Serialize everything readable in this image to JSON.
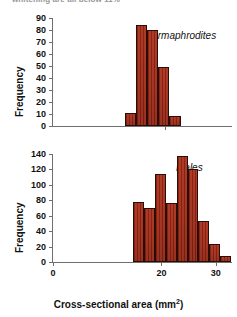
{
  "caption_sliver": "whitening are all below 11%",
  "colors": {
    "bar_fill": "#a32a16",
    "bar_edge": "#2a0d06",
    "axis": "#6f6f6f"
  },
  "axis_titles": {
    "y": "Frequency",
    "x_main": "Cross-sectional area (mm",
    "x_sup": "2",
    "x_close": ")"
  },
  "chart_data": [
    {
      "type": "bar",
      "title": "",
      "series_label": "Hermaphrodites",
      "xlabel": "Cross-sectional area (mm2)",
      "ylabel": "Frequency",
      "ylim": [
        0,
        90
      ],
      "yticks": [
        0,
        10,
        20,
        30,
        40,
        50,
        60,
        70,
        80,
        90
      ],
      "ytick_labels": [
        "0",
        "10",
        "20",
        "30",
        "40",
        "50",
        "60",
        "70",
        "80",
        "90"
      ],
      "xlim": [
        0,
        32
      ],
      "xticks": [
        20
      ],
      "xtick_labels": [
        ""
      ],
      "bin_edges": [
        13,
        15,
        17,
        19,
        21,
        23
      ],
      "values": [
        11,
        84,
        80,
        49,
        8
      ],
      "grid": false,
      "legend": "none"
    },
    {
      "type": "bar",
      "title": "",
      "series_label": "Males",
      "xlabel": "Cross-sectional area (mm2)",
      "ylabel": "Frequency",
      "ylim": [
        0,
        140
      ],
      "yticks": [
        0,
        20,
        40,
        60,
        80,
        100,
        120,
        140
      ],
      "ytick_labels": [
        "0",
        "20",
        "40",
        "60",
        "80",
        "100",
        "120",
        "140"
      ],
      "xlim": [
        0,
        33
      ],
      "xticks": [
        0,
        20,
        30
      ],
      "xtick_labels": [
        "0",
        "20",
        "30"
      ],
      "bin_edges": [
        15,
        17,
        19,
        21,
        23,
        25,
        27,
        29,
        31,
        33
      ],
      "values": [
        78,
        70,
        114,
        76,
        137,
        121,
        53,
        23,
        8
      ],
      "grid": false,
      "legend": "none"
    }
  ]
}
